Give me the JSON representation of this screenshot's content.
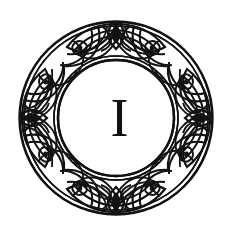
{
  "artwork": {
    "kind": "decorative-initial",
    "title": "Celtic knotwork circular border with initial letter",
    "letter": "I",
    "letter_color": "#111111",
    "ink_color": "#121212",
    "background_color": "#ffffff",
    "ornament_name": "celtic-knot-ring",
    "geometry": {
      "center_x": 116,
      "center_y": 118,
      "outer_radius": 97,
      "inner_radius": 58,
      "band_width": 39
    },
    "motifs": {
      "top": "diamond-leaf-cartouche",
      "bottom": "diamond-leaf-cartouche",
      "left": "diamond-knot-node",
      "right": "diamond-knot-node",
      "band": "interlaced-oval-strapwork",
      "repeat_count": 4
    }
  }
}
